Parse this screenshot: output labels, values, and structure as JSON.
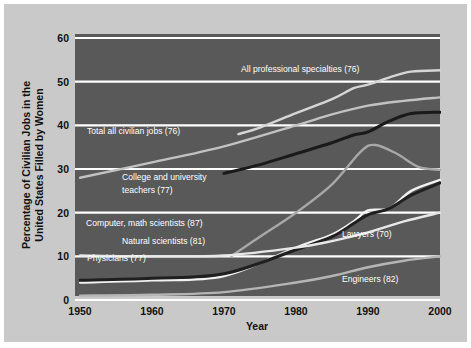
{
  "chart_data": {
    "type": "line",
    "title": "",
    "xlabel": "Year",
    "ylabel": "Percentage of Civilian Jobs in the United States Filled by Women",
    "xlim": [
      1950,
      2000
    ],
    "ylim": [
      0,
      60
    ],
    "xticks": [
      "1950",
      "1960",
      "1970",
      "1980",
      "1990",
      "2000"
    ],
    "yticks": [
      "0",
      "10",
      "20",
      "30",
      "40",
      "50",
      "60"
    ],
    "grid": "horizontal",
    "legend": "inline-labels",
    "plot_background": "#595959",
    "figure_background": "#c9c9c9",
    "gridline_color": "#ffffff",
    "series": [
      {
        "name": "All professional specialties (76)",
        "label": "All professional specialties (76)",
        "color": "#d6d6d6",
        "x": [
          1972,
          1975,
          1980,
          1985,
          1988,
          1990,
          1993,
          1996,
          2000
        ],
        "values": [
          38.0,
          39.5,
          42.8,
          46.0,
          48.5,
          49.3,
          51.0,
          52.3,
          52.6
        ]
      },
      {
        "name": "Total all civilian jobs (76)",
        "label": "Total all civilian jobs (76)",
        "color": "#c2c2c2",
        "x": [
          1950,
          1960,
          1970,
          1980,
          1985,
          1990,
          1995,
          2000
        ],
        "values": [
          28.0,
          31.5,
          35.2,
          40.0,
          42.5,
          44.5,
          45.6,
          46.4
        ]
      },
      {
        "name": "College and university teachers (77)",
        "label": "College and university teachers (77)",
        "color": "#1a1a1a",
        "x": [
          1970,
          1975,
          1980,
          1985,
          1988,
          1990,
          1993,
          1996,
          2000
        ],
        "values": [
          29.0,
          31.0,
          33.5,
          36.0,
          37.8,
          38.5,
          41.0,
          42.7,
          43.0
        ]
      },
      {
        "name": "Computer, math scientists (87)",
        "label": "Computer, math scientists (87)",
        "color": "#a8a8a8",
        "x": [
          1971,
          1975,
          1980,
          1985,
          1989,
          1991,
          1994,
          1997,
          2000
        ],
        "values": [
          10.0,
          14.5,
          20.0,
          26.5,
          34.0,
          35.5,
          33.5,
          30.5,
          29.8
        ]
      },
      {
        "name": "Lawyers (70)",
        "label": "Lawyers (70)",
        "color": "#f2f2f2",
        "x": [
          1950,
          1960,
          1970,
          1980,
          1985,
          1988,
          1990,
          1993,
          1996,
          2000
        ],
        "values": [
          4.0,
          4.5,
          5.5,
          12.0,
          15.0,
          18.0,
          20.5,
          21.0,
          25.0,
          27.5
        ]
      },
      {
        "name": "Natural scientists (81)",
        "label": "Natural scientists (81)",
        "color": "#1f1f1f",
        "x": [
          1950,
          1960,
          1970,
          1980,
          1985,
          1988,
          1990,
          1993,
          1996,
          2000
        ],
        "values": [
          4.5,
          5.0,
          6.0,
          11.5,
          14.5,
          17.5,
          19.5,
          21.0,
          24.0,
          26.8
        ]
      },
      {
        "name": "Physicians (77)",
        "label": "Physicians (77)",
        "color": "#e8e8e8",
        "x": [
          1950,
          1960,
          1970,
          1980,
          1985,
          1990,
          1995,
          2000
        ],
        "values": [
          10.2,
          10.0,
          10.2,
          12.0,
          13.5,
          15.5,
          18.0,
          20.0
        ]
      },
      {
        "name": "Engineers (82)",
        "label": "Engineers (82)",
        "color": "#b5b5b5",
        "x": [
          1950,
          1960,
          1970,
          1980,
          1985,
          1990,
          1995,
          2000
        ],
        "values": [
          1.0,
          1.2,
          1.8,
          4.0,
          5.5,
          7.5,
          9.0,
          10.0
        ]
      }
    ],
    "annotations": [
      {
        "text": "All professional specialties (76)",
        "x": 237,
        "y": 68
      },
      {
        "text": "Total all civilian jobs (76)",
        "x": 83,
        "y": 130
      },
      {
        "text": "College and university",
        "x": 118,
        "y": 176
      },
      {
        "text": "teachers (77)",
        "x": 118,
        "y": 189
      },
      {
        "text": "Computer, math scientists (87)",
        "x": 82,
        "y": 222
      },
      {
        "text": "Natural scientists (81)",
        "x": 118,
        "y": 240
      },
      {
        "text": "Physicians (77)",
        "x": 83,
        "y": 257
      },
      {
        "text": "Lawyers (70)",
        "x": 338,
        "y": 233
      },
      {
        "text": "Engineers (82)",
        "x": 338,
        "y": 278
      }
    ]
  }
}
